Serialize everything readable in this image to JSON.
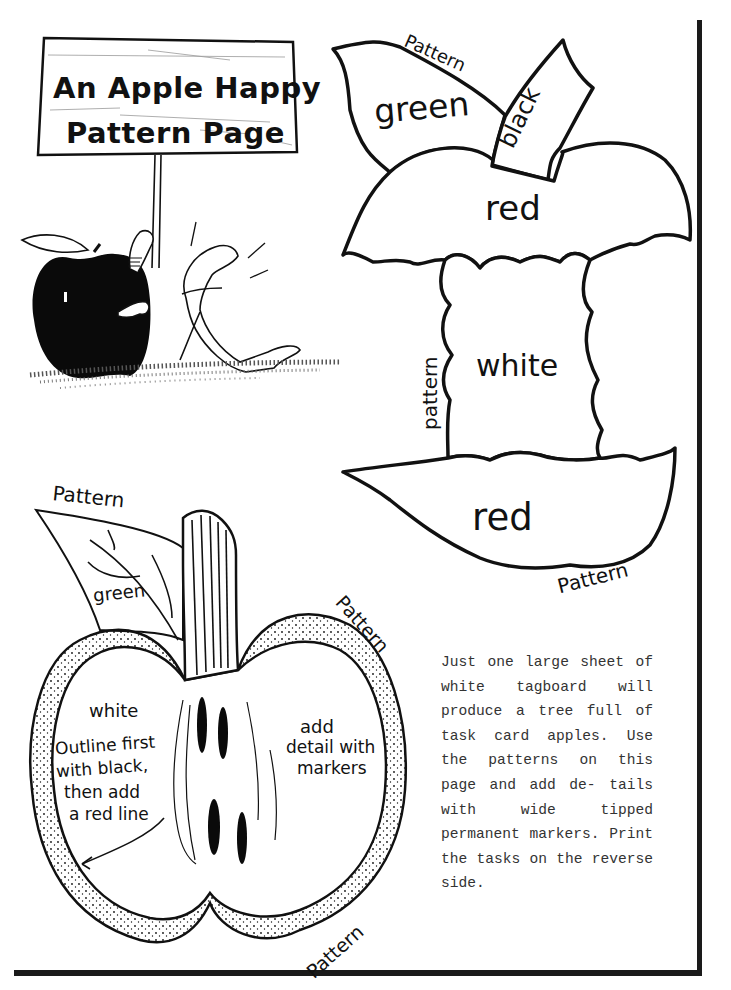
{
  "sign": {
    "line1": "An Apple Happy",
    "line2": "Pattern Page"
  },
  "top_apple_pattern": {
    "leaf_pattern_label": "Pattern",
    "leaf_color": "green",
    "stem_color": "black",
    "top_color": "red",
    "core_side_label": "pattern",
    "core_color": "white",
    "bottom_color": "red",
    "bottom_pattern_label": "Pattern"
  },
  "half_apple_pattern": {
    "leaf_pattern_label": "Pattern",
    "leaf_color": "green",
    "skin_pattern_label_top": "Pattern",
    "flesh_color": "white",
    "instruction_line1": "Outline first",
    "instruction_line2": "with black,",
    "instruction_line3": "then add",
    "instruction_line4": "a red line",
    "detail_line1": "add",
    "detail_line2": "detail with",
    "detail_line3": "markers",
    "skin_pattern_label_bottom": "Pattern"
  },
  "instructions": {
    "paragraph": "Just one large sheet of white tagboard will produce a tree full of task card apples. Use the patterns on this page and add de- tails with wide tipped permanent markers. Print the tasks on the reverse side."
  },
  "colors": {
    "ink": "#111111",
    "paper": "#ffffff",
    "typewriter": "#333333"
  }
}
